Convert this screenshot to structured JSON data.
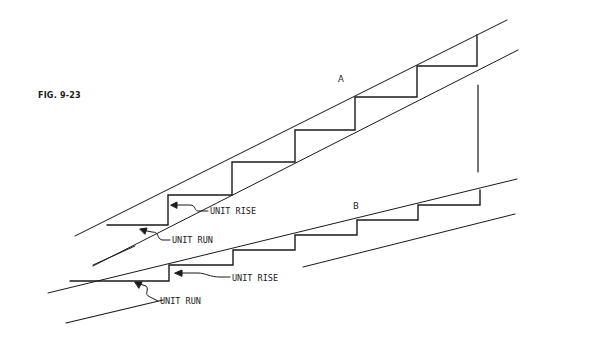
{
  "figure": {
    "title": "FIG. 9-23"
  },
  "stairs": [
    {
      "id": "A",
      "label": "A",
      "annotations": {
        "rise_label": "UNIT RISE",
        "run_label": "UNIT RUN"
      }
    },
    {
      "id": "B",
      "label": "B",
      "annotations": {
        "rise_label": "UNIT RISE",
        "run_label": "UNIT RUN"
      }
    }
  ],
  "colors": {
    "line": "#1a1a1a",
    "background": "#ffffff"
  }
}
